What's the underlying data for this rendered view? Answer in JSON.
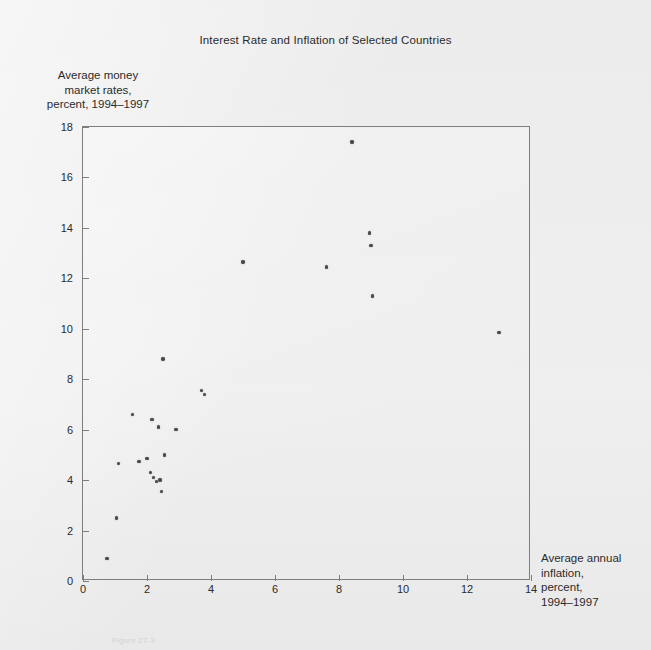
{
  "figure": {
    "title": "Interest Rate and Inflation of Selected Countries",
    "caption": "Figure 27-3"
  },
  "axes": {
    "y_label_line1": "Average money",
    "y_label_line2": "market rates,",
    "y_label_line3": "percent, 1994–1997",
    "x_label_line1": "Average annual",
    "x_label_line2": "inflation,",
    "x_label_line3": "percent,",
    "x_label_line4": "1994–1997"
  },
  "chart_data": {
    "type": "scatter",
    "title": "Interest Rate and Inflation of Selected Countries",
    "xlabel": "Average annual inflation, percent, 1994–1997",
    "ylabel": "Average money market rates, percent, 1994–1997",
    "xlim": [
      0,
      14
    ],
    "ylim": [
      0,
      18
    ],
    "xticks": [
      0,
      2,
      4,
      6,
      8,
      10,
      12,
      14
    ],
    "yticks": [
      0,
      2,
      4,
      6,
      8,
      10,
      12,
      14,
      16,
      18
    ],
    "xtick_labels": [
      "0",
      "2",
      "4",
      "6",
      "8",
      "10",
      "12",
      "14"
    ],
    "ytick_labels": [
      "0",
      "2",
      "4",
      "6",
      "8",
      "10",
      "12",
      "14",
      "16",
      "18"
    ],
    "grid": false,
    "legend": null,
    "marker": "filled-circle",
    "marker_color": "#4a4a4a",
    "frame_color": "#7e7e7e",
    "background_color": "#ececec",
    "points": [
      {
        "x": 0.75,
        "y": 0.9
      },
      {
        "x": 1.05,
        "y": 2.5
      },
      {
        "x": 1.1,
        "y": 4.65
      },
      {
        "x": 1.55,
        "y": 6.6
      },
      {
        "x": 1.75,
        "y": 4.75
      },
      {
        "x": 2.0,
        "y": 4.85
      },
      {
        "x": 2.1,
        "y": 4.3
      },
      {
        "x": 2.15,
        "y": 6.4
      },
      {
        "x": 2.2,
        "y": 4.1
      },
      {
        "x": 2.3,
        "y": 3.95
      },
      {
        "x": 2.35,
        "y": 6.1
      },
      {
        "x": 2.4,
        "y": 4.0
      },
      {
        "x": 2.45,
        "y": 3.55
      },
      {
        "x": 2.5,
        "y": 8.8
      },
      {
        "x": 2.55,
        "y": 5.0
      },
      {
        "x": 2.9,
        "y": 6.0
      },
      {
        "x": 3.7,
        "y": 7.55
      },
      {
        "x": 3.8,
        "y": 7.4
      },
      {
        "x": 5.0,
        "y": 12.65
      },
      {
        "x": 7.6,
        "y": 12.45
      },
      {
        "x": 8.4,
        "y": 17.4
      },
      {
        "x": 8.95,
        "y": 13.8
      },
      {
        "x": 9.0,
        "y": 13.3
      },
      {
        "x": 9.05,
        "y": 11.3
      },
      {
        "x": 13.0,
        "y": 9.85
      }
    ]
  }
}
